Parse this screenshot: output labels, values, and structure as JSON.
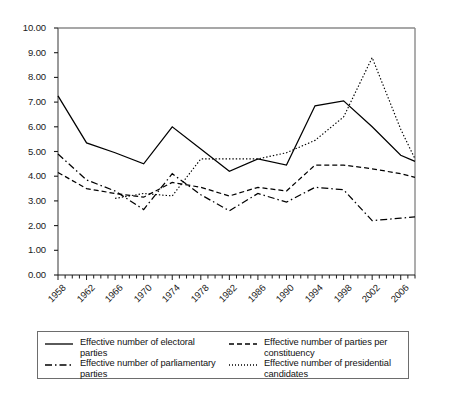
{
  "chart_data": {
    "type": "line",
    "title": "",
    "xlabel": "",
    "ylabel": "",
    "ylim": [
      0,
      10
    ],
    "xlim": [
      1958,
      2008
    ],
    "grid": false,
    "legend_position": "bottom",
    "ytick_labels": [
      "10.00",
      "9.00",
      "8.00",
      "7.00",
      "6.00",
      "5.00",
      "4.00",
      "3.00",
      "2.00",
      "1.00",
      "0.00"
    ],
    "ytick_values": [
      10,
      9,
      8,
      7,
      6,
      5,
      4,
      3,
      2,
      1,
      0
    ],
    "xtick_labels": [
      "1958",
      "1962",
      "1966",
      "1970",
      "1974",
      "1978",
      "1982",
      "1986",
      "1990",
      "1994",
      "1998",
      "2002",
      "2006"
    ],
    "xtick_values": [
      1958,
      1962,
      1966,
      1970,
      1974,
      1978,
      1982,
      1986,
      1990,
      1994,
      1998,
      2002,
      2006
    ],
    "minor_tick_interval": 1,
    "series": [
      {
        "name": "Effective number of electoral parties",
        "style": "solid",
        "x": [
          1958,
          1962,
          1966,
          1970,
          1974,
          1978,
          1982,
          1986,
          1990,
          1994,
          1998,
          2002,
          2006,
          2008
        ],
        "values": [
          7.25,
          5.35,
          4.95,
          4.5,
          6.0,
          5.1,
          4.2,
          4.7,
          4.45,
          6.85,
          7.05,
          6.0,
          4.85,
          4.6
        ]
      },
      {
        "name": "Effective number of parties per constituency",
        "style": "dashed",
        "x": [
          1958,
          1962,
          1966,
          1970,
          1974,
          1978,
          1982,
          1986,
          1990,
          1994,
          1998,
          2002,
          2006,
          2008
        ],
        "values": [
          4.15,
          3.5,
          3.3,
          3.15,
          3.75,
          3.55,
          3.2,
          3.55,
          3.4,
          4.45,
          4.45,
          4.3,
          4.1,
          3.95
        ]
      },
      {
        "name": "Effective number of parliamentary parties",
        "style": "dashdot",
        "x": [
          1958,
          1962,
          1966,
          1970,
          1974,
          1978,
          1982,
          1986,
          1990,
          1994,
          1998,
          2002,
          2006,
          2008
        ],
        "values": [
          4.9,
          3.85,
          3.4,
          2.65,
          4.1,
          3.25,
          2.6,
          3.3,
          2.95,
          3.55,
          3.45,
          2.2,
          2.3,
          2.35
        ]
      },
      {
        "name": "Effective number of presidential candidates",
        "style": "dotted",
        "x": [
          1966,
          1970,
          1974,
          1978,
          1982,
          1986,
          1990,
          1994,
          1998,
          2002,
          2006,
          2008
        ],
        "values": [
          3.1,
          3.3,
          3.2,
          4.7,
          4.7,
          4.7,
          4.95,
          5.45,
          6.4,
          8.8,
          5.9,
          4.7
        ]
      }
    ]
  },
  "legend": {
    "entries": [
      {
        "label": "Effective number of electoral parties",
        "style": "solid"
      },
      {
        "label": "Effective number of parties per constituency",
        "style": "dashed"
      },
      {
        "label": "Effective number of parliamentary parties",
        "style": "dashdot"
      },
      {
        "label": "Effective number of presidential candidates",
        "style": "dotted"
      }
    ]
  }
}
